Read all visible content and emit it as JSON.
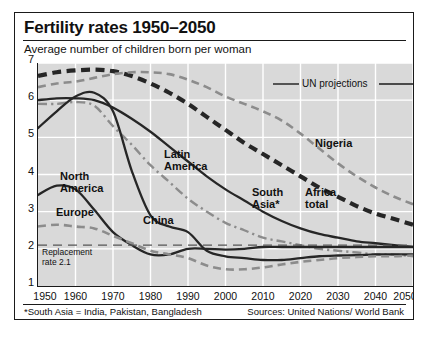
{
  "header": {
    "title": "Fertility rates 1950–2050",
    "subtitle": "Average number of children born per woman"
  },
  "footer": {
    "footnote": "*South Asia = India, Pakistan, Bangladesh",
    "sources": "Sources: United Nations/ World Bank"
  },
  "legend": {
    "projection_label": "UN projections"
  },
  "annotations": {
    "replacement": "Replacement\nrate 2.1"
  },
  "colors": {
    "frame": "#1a1a1a",
    "plot_background": "#d9d9d9",
    "gridline": "#ffffff",
    "dark_series": "#262626",
    "light_series": "#8c8c8c",
    "text": "#111111"
  },
  "chart_data": {
    "type": "line",
    "title": "Fertility rates 1950–2050",
    "subtitle": "Average number of children born per woman",
    "xlabel": "",
    "ylabel": "Average number of children born per woman",
    "xlim": [
      1950,
      2050
    ],
    "ylim": [
      1,
      7
    ],
    "xticks": [
      1950,
      1960,
      1970,
      1980,
      1990,
      2000,
      2010,
      2020,
      2030,
      2040,
      2050
    ],
    "yticks": [
      1,
      2,
      3,
      4,
      5,
      6,
      7
    ],
    "grid": true,
    "legend_position": "in-plot labels",
    "projection_start": 2005,
    "reference_lines": [
      {
        "name": "Replacement rate",
        "y": 2.1,
        "style": "dashed",
        "label": "Replacement\nrate 2.1"
      }
    ],
    "x": [
      1950,
      1955,
      1960,
      1965,
      1970,
      1975,
      1980,
      1985,
      1990,
      1995,
      2000,
      2005,
      2010,
      2015,
      2020,
      2025,
      2030,
      2035,
      2040,
      2045,
      2050
    ],
    "series": [
      {
        "name": "Africa total",
        "label": "Africa\ntotal",
        "style": "bold-dashed",
        "color": "#262626",
        "values": [
          6.65,
          6.75,
          6.8,
          6.82,
          6.78,
          6.65,
          6.45,
          6.2,
          5.9,
          5.55,
          5.2,
          4.85,
          4.55,
          4.25,
          3.95,
          3.65,
          3.4,
          3.15,
          2.95,
          2.8,
          2.65
        ]
      },
      {
        "name": "Nigeria",
        "label": "Nigeria",
        "style": "light-dashed",
        "color": "#8c8c8c",
        "values": [
          6.35,
          6.45,
          6.5,
          6.6,
          6.7,
          6.75,
          6.75,
          6.7,
          6.55,
          6.35,
          6.1,
          5.9,
          5.7,
          5.45,
          5.1,
          4.7,
          4.3,
          3.95,
          3.65,
          3.4,
          3.2
        ]
      },
      {
        "name": "South Asia*",
        "label": "South\nAsia*",
        "style": "solid-dark",
        "color": "#262626",
        "values": [
          6.0,
          6.05,
          6.05,
          6.0,
          5.8,
          5.5,
          5.15,
          4.75,
          4.35,
          3.95,
          3.6,
          3.3,
          3.0,
          2.75,
          2.55,
          2.4,
          2.3,
          2.2,
          2.15,
          2.1,
          2.05
        ]
      },
      {
        "name": "Latin America",
        "label": "Latin\nAmerica",
        "style": "light-dashdot",
        "color": "#8c8c8c",
        "values": [
          5.9,
          5.9,
          5.95,
          5.85,
          5.3,
          4.8,
          4.25,
          3.8,
          3.35,
          3.0,
          2.7,
          2.5,
          2.3,
          2.2,
          2.1,
          2.0,
          1.95,
          1.9,
          1.85,
          1.85,
          1.8
        ]
      },
      {
        "name": "China",
        "label": "China",
        "style": "solid-dark",
        "color": "#262626",
        "values": [
          5.25,
          5.7,
          6.1,
          6.2,
          5.7,
          4.1,
          2.9,
          2.6,
          2.45,
          1.95,
          1.8,
          1.75,
          1.7,
          1.7,
          1.75,
          1.8,
          1.82,
          1.83,
          1.85,
          1.85,
          1.85
        ]
      },
      {
        "name": "North America",
        "label": "North\nAmerica",
        "style": "solid-dark",
        "color": "#262626",
        "values": [
          3.45,
          3.7,
          3.6,
          3.05,
          2.45,
          2.1,
          1.85,
          1.85,
          2.0,
          2.0,
          1.98,
          2.0,
          2.05,
          2.05,
          2.05,
          2.05,
          2.05,
          2.05,
          2.05,
          2.05,
          2.05
        ]
      },
      {
        "name": "Europe",
        "label": "Europe",
        "style": "light-dashed",
        "color": "#8c8c8c",
        "values": [
          2.6,
          2.65,
          2.6,
          2.55,
          2.35,
          2.15,
          1.95,
          1.85,
          1.75,
          1.55,
          1.45,
          1.45,
          1.5,
          1.58,
          1.65,
          1.7,
          1.75,
          1.78,
          1.8,
          1.8,
          1.82
        ]
      }
    ],
    "series_labels": [
      {
        "text": "North\nAmerica",
        "x_px": 45,
        "y_px": 158
      },
      {
        "text": "Europe",
        "x_px": 41,
        "y_px": 194
      },
      {
        "text": "China",
        "x_px": 128,
        "y_px": 202
      },
      {
        "text": "Latin\nAmerica",
        "x_px": 149,
        "y_px": 136
      },
      {
        "text": "South\nAsia*",
        "x_px": 237,
        "y_px": 174
      },
      {
        "text": "Africa\ntotal",
        "x_px": 290,
        "y_px": 174
      },
      {
        "text": "Nigeria",
        "x_px": 300,
        "y_px": 125
      }
    ]
  }
}
